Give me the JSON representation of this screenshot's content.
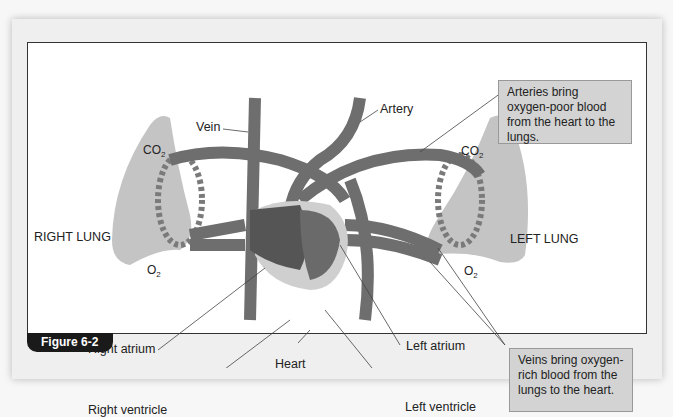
{
  "figure": {
    "label": "Figure 6-2"
  },
  "labels": {
    "vein": "Vein",
    "artery": "Artery",
    "right_lung": "RIGHT LUNG",
    "left_lung": "LEFT LUNG",
    "right_atrium": "Right atrium",
    "right_ventricle": "Right ventricle",
    "heart": "Heart",
    "left_atrium": "Left atrium",
    "left_ventricle": "Left ventricle"
  },
  "chemicals": {
    "co2_base": "CO",
    "co2_sub": "2",
    "o2_base": "O",
    "o2_sub": "2"
  },
  "callouts": {
    "arteries": "Arteries bring oxygen-poor blood from the heart to the lungs.",
    "veins": "Veins bring oxygen-rich blood from the lungs to the heart."
  },
  "colors": {
    "vessel": "#6f6f6f",
    "heart_dark": "#5a5a5a",
    "heart_light": "#c8c8c8",
    "lung": "#bdbdbd",
    "callout_bg": "#d3d3d3"
  }
}
